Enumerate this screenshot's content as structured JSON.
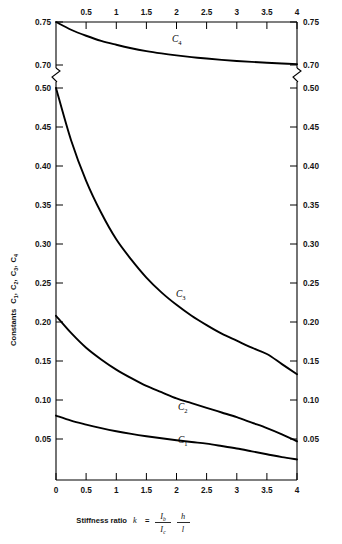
{
  "chart_data": {
    "type": "line",
    "title": "",
    "xlabel": "Stiffness ratio k = (Ib/Ic)(h/l)",
    "ylabel": "Constants C1, C2, C3, C4",
    "xlim": [
      0,
      4
    ],
    "grid": false,
    "legend": "inline-curve-labels",
    "axis_break": {
      "present": true,
      "upper_range": [
        0.7,
        0.75
      ],
      "lower_range": [
        0.0,
        0.5
      ],
      "note": "y axis broken between 0.50 and 0.70"
    },
    "x_ticks_bottom": [
      "0",
      "0.5",
      "1",
      "1.5",
      "2",
      "2.5",
      "3",
      "3.5",
      "4"
    ],
    "x_ticks_top": [
      "0.5",
      "1",
      "1.5",
      "2",
      "2.5",
      "3",
      "3.5",
      "4"
    ],
    "x_tick_values": [
      0,
      0.5,
      1,
      1.5,
      2,
      2.5,
      3,
      3.5,
      4
    ],
    "y_ticks_upper": [
      "0.75",
      "0.70"
    ],
    "y_tick_values_upper": [
      0.75,
      0.7
    ],
    "y_ticks_lower": [
      "0.50",
      "0.45",
      "0.40",
      "0.35",
      "0.30",
      "0.25",
      "0.20",
      "0.15",
      "0.10",
      "0.05"
    ],
    "y_tick_values_lower": [
      0.5,
      0.45,
      0.4,
      0.35,
      0.3,
      0.25,
      0.2,
      0.15,
      0.1,
      0.05
    ],
    "x": [
      0,
      0.25,
      0.5,
      0.75,
      1,
      1.25,
      1.5,
      1.75,
      2,
      2.25,
      2.5,
      2.75,
      3,
      3.25,
      3.5,
      3.75,
      4
    ],
    "series": [
      {
        "name": "C4",
        "label": "C",
        "subscript": "4",
        "color": "#000000",
        "values": [
          0.75,
          0.741,
          0.734,
          0.728,
          0.7235,
          0.7195,
          0.7162,
          0.7135,
          0.7112,
          0.7092,
          0.7075,
          0.706,
          0.7047,
          0.7036,
          0.7026,
          0.7018,
          0.701
        ]
      },
      {
        "name": "C3",
        "label": "C",
        "subscript": "3",
        "color": "#000000",
        "values": [
          0.5,
          0.433,
          0.381,
          0.34,
          0.306,
          0.28,
          0.257,
          0.238,
          0.222,
          0.208,
          0.196,
          0.185,
          0.176,
          0.167,
          0.159,
          0.146,
          0.133
        ]
      },
      {
        "name": "C2",
        "label": "C",
        "subscript": "2",
        "color": "#000000",
        "values": [
          0.208,
          0.186,
          0.167,
          0.152,
          0.139,
          0.128,
          0.118,
          0.11,
          0.102,
          0.096,
          0.09,
          0.084,
          0.078,
          0.071,
          0.064,
          0.056,
          0.047
        ]
      },
      {
        "name": "C1",
        "label": "C",
        "subscript": "1",
        "color": "#000000",
        "values": [
          0.08,
          0.0735,
          0.0685,
          0.064,
          0.06,
          0.0566,
          0.0536,
          0.0509,
          0.0484,
          0.0461,
          0.044,
          0.041,
          0.0378,
          0.0342,
          0.0305,
          0.0268,
          0.0238
        ]
      }
    ],
    "curve_labels": [
      {
        "name": "C4",
        "label": "C",
        "subscript": "4",
        "x_px": 172,
        "y_px": 42
      },
      {
        "name": "C3",
        "label": "C",
        "subscript": "3",
        "x_px": 176,
        "y_px": 297
      },
      {
        "name": "C2",
        "label": "C",
        "subscript": "2",
        "x_px": 178,
        "y_px": 410
      },
      {
        "name": "C1",
        "label": "C",
        "subscript": "1",
        "x_px": 178,
        "y_px": 443
      }
    ],
    "ylabel_parts": {
      "word": "Constants",
      "c1": "C",
      "c1s": "1",
      "c2": "C",
      "c2s": "2",
      "c3": "C",
      "c3s": "3",
      "c4": "C",
      "c4s": "4",
      "sep": ","
    },
    "xlabel_parts": {
      "text": "Stiffness ratio",
      "k": "k",
      "eq": "=",
      "num1": "I",
      "num1sub": "b",
      "den1": "I",
      "den1sub": "c",
      "num2": "h",
      "den2": "l"
    }
  }
}
